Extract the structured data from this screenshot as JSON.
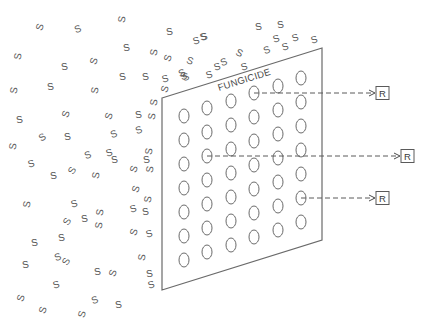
{
  "diagram": {
    "panel_label": "FUNGICIDE",
    "spore_letter": "S",
    "resistant_letter": "R",
    "spore_count": 86,
    "pore_grid": {
      "columns": 6,
      "rows": 7
    },
    "resistant_passages": [
      {
        "label": "R",
        "from_pore": {
          "column": 4,
          "row": 1
        }
      },
      {
        "label": "R",
        "from_pore": {
          "column": 2,
          "row": 3
        }
      },
      {
        "label": "R",
        "from_pore": {
          "column": 6,
          "row": 6
        }
      }
    ],
    "colors": {
      "line": "#6a6a6a",
      "text": "#4a4a4a",
      "background": "#ffffff"
    }
  }
}
